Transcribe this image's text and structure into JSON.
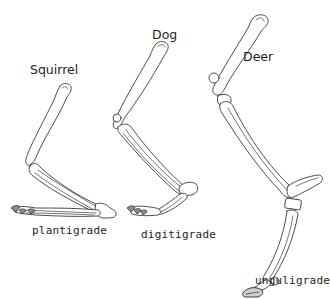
{
  "diagram": {
    "type": "comparative-anatomy",
    "colors": {
      "background": "#ffffff",
      "line": "#3a3a3a",
      "text": "#1e1e1e"
    },
    "panels": [
      {
        "species": "Squirrel",
        "posture": "plantigrade"
      },
      {
        "species": "Dog",
        "posture": "digitigrade"
      },
      {
        "species": "Deer",
        "posture": "unguligrade"
      }
    ]
  }
}
